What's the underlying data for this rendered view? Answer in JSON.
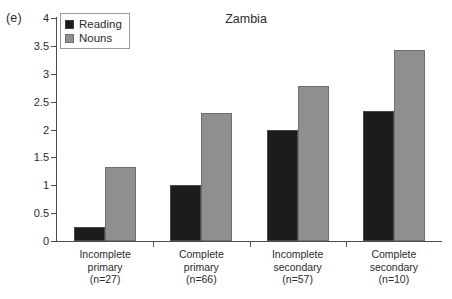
{
  "panel_label": "(e)",
  "chart_data": {
    "type": "bar",
    "title": "Zambia",
    "xlabel": "",
    "ylabel": "",
    "ylim": [
      0,
      4
    ],
    "ytick_step": 0.5,
    "grid": false,
    "legend_position": "top-left-inside",
    "categories": [
      "Incomplete primary",
      "Complete primary",
      "Incomplete secondary",
      "Complete secondary"
    ],
    "category_lines": [
      [
        "Incomplete",
        "primary",
        "(n=27)"
      ],
      [
        "Complete",
        "primary",
        "(n=66)"
      ],
      [
        "Incomplete",
        "secondary",
        "(n=57)"
      ],
      [
        "Complete",
        "secondary",
        "(n=10)"
      ]
    ],
    "sample_sizes": [
      27,
      66,
      57,
      10
    ],
    "ytick_labels": [
      "4",
      "3.5",
      "3",
      "2.5",
      "2",
      "1.5",
      "1",
      "0.5",
      "0"
    ],
    "ytick_values": [
      4,
      3.5,
      3,
      2.5,
      2,
      1.5,
      1,
      0.5,
      0
    ],
    "series": [
      {
        "name": "Reading",
        "color": "#1c1c1c",
        "values": [
          0.25,
          1.0,
          2.0,
          2.33
        ]
      },
      {
        "name": "Nouns",
        "color": "#8f8f8f",
        "values": [
          1.33,
          2.3,
          2.78,
          3.43
        ]
      }
    ]
  }
}
